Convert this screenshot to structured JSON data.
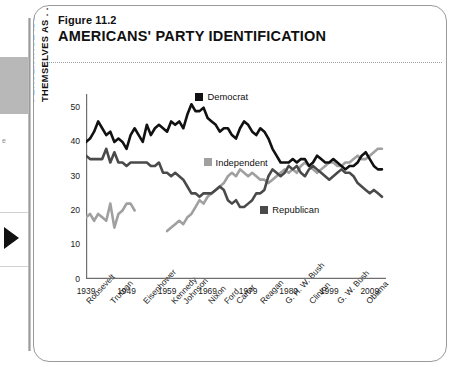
{
  "gutter": {
    "snippet_text": "e",
    "arrow_icon": "play-triangle-icon"
  },
  "figure": {
    "label": "Figure 11.2",
    "title": "AMERICANS' PARTY IDENTIFICATION"
  },
  "colors": {
    "democrat": "#111111",
    "republican": "#4a4a4a",
    "independent": "#a0a0a0",
    "axis": "#6f6f6f"
  },
  "chart_data": {
    "type": "line",
    "title": "AMERICANS' PARTY IDENTIFICATION",
    "xlabel": "",
    "ylabel": "PERCENTAGE IDENTIFYING THEMSELVES AS . . .",
    "ylabel_line1": "PERCENTAGE IDENTIFYING",
    "ylabel_line2": "THEMSELVES AS . . .",
    "xlim": [
      1939,
      2013
    ],
    "ylim": [
      0,
      54
    ],
    "yticks": [
      0,
      10,
      20,
      30,
      40,
      50
    ],
    "xticks": [
      1939,
      1949,
      1959,
      1969,
      1979,
      1989,
      1999,
      2009
    ],
    "grid": false,
    "legend_position": "inside-plot",
    "presidents": [
      "Roosevelt",
      "Truman",
      "Eisenhower",
      "Kennedy",
      "Johnson",
      "Nixon",
      "Ford",
      "Carter",
      "Reagan",
      "G. H. W. Bush",
      "Clinton",
      "G. W. Bush",
      "Obama"
    ],
    "president_years": [
      1941,
      1947,
      1955,
      1962,
      1965,
      1971,
      1975,
      1978,
      1984,
      1990,
      1996,
      2003,
      2010
    ],
    "legend": [
      {
        "name": "Democrat",
        "color": "#111111",
        "label_year": 1966,
        "label_value": 53
      },
      {
        "name": "Independent",
        "color": "#a0a0a0",
        "label_year": 1968,
        "label_value": 34
      },
      {
        "name": "Republican",
        "color": "#4a4a4a",
        "label_year": 1982,
        "label_value": 20
      }
    ],
    "series": [
      {
        "name": "Democrat",
        "color": "#111111",
        "points": [
          [
            1939,
            40
          ],
          [
            1940,
            41
          ],
          [
            1941,
            43
          ],
          [
            1942,
            46
          ],
          [
            1943,
            44
          ],
          [
            1944,
            42
          ],
          [
            1945,
            43
          ],
          [
            1946,
            40
          ],
          [
            1947,
            41
          ],
          [
            1948,
            40
          ],
          [
            1949,
            38
          ],
          [
            1950,
            42
          ],
          [
            1951,
            44
          ],
          [
            1952,
            42
          ],
          [
            1953,
            40
          ],
          [
            1954,
            45
          ],
          [
            1955,
            42
          ],
          [
            1956,
            44
          ],
          [
            1957,
            45
          ],
          [
            1958,
            44
          ],
          [
            1959,
            43
          ],
          [
            1960,
            46
          ],
          [
            1961,
            45
          ],
          [
            1962,
            46
          ],
          [
            1963,
            44
          ],
          [
            1964,
            48
          ],
          [
            1965,
            51
          ],
          [
            1966,
            49
          ],
          [
            1967,
            49
          ],
          [
            1968,
            50
          ],
          [
            1969,
            47
          ],
          [
            1970,
            46
          ],
          [
            1971,
            45
          ],
          [
            1972,
            43
          ],
          [
            1973,
            44
          ],
          [
            1974,
            44
          ],
          [
            1975,
            42
          ],
          [
            1976,
            41
          ],
          [
            1977,
            44
          ],
          [
            1978,
            46
          ],
          [
            1979,
            45
          ],
          [
            1980,
            43
          ],
          [
            1981,
            42
          ],
          [
            1982,
            44
          ],
          [
            1983,
            43
          ],
          [
            1984,
            41
          ],
          [
            1985,
            38
          ],
          [
            1986,
            36
          ],
          [
            1987,
            34
          ],
          [
            1988,
            34
          ],
          [
            1989,
            34
          ],
          [
            1990,
            35
          ],
          [
            1991,
            34
          ],
          [
            1992,
            35
          ],
          [
            1993,
            35
          ],
          [
            1994,
            33
          ],
          [
            1995,
            34
          ],
          [
            1996,
            36
          ],
          [
            1997,
            35
          ],
          [
            1998,
            34
          ],
          [
            1999,
            34
          ],
          [
            2000,
            35
          ],
          [
            2001,
            34
          ],
          [
            2002,
            33
          ],
          [
            2003,
            32
          ],
          [
            2004,
            33
          ],
          [
            2005,
            33
          ],
          [
            2006,
            34
          ],
          [
            2007,
            36
          ],
          [
            2008,
            37
          ],
          [
            2009,
            35
          ],
          [
            2010,
            33
          ],
          [
            2011,
            32
          ],
          [
            2012,
            32
          ]
        ]
      },
      {
        "name": "Republican",
        "color": "#4a4a4a",
        "points": [
          [
            1939,
            36
          ],
          [
            1940,
            35
          ],
          [
            1941,
            35
          ],
          [
            1942,
            35
          ],
          [
            1943,
            35
          ],
          [
            1944,
            38
          ],
          [
            1945,
            34
          ],
          [
            1946,
            37
          ],
          [
            1947,
            34
          ],
          [
            1948,
            34
          ],
          [
            1949,
            33
          ],
          [
            1950,
            34
          ],
          [
            1951,
            34
          ],
          [
            1952,
            34
          ],
          [
            1953,
            34
          ],
          [
            1954,
            34
          ],
          [
            1955,
            33
          ],
          [
            1956,
            33
          ],
          [
            1957,
            34
          ],
          [
            1958,
            31
          ],
          [
            1959,
            31
          ],
          [
            1960,
            30
          ],
          [
            1961,
            31
          ],
          [
            1962,
            30
          ],
          [
            1963,
            29
          ],
          [
            1964,
            27
          ],
          [
            1965,
            25
          ],
          [
            1966,
            25
          ],
          [
            1967,
            24
          ],
          [
            1968,
            25
          ],
          [
            1969,
            25
          ],
          [
            1970,
            25
          ],
          [
            1971,
            26
          ],
          [
            1972,
            27
          ],
          [
            1973,
            26
          ],
          [
            1974,
            23
          ],
          [
            1975,
            22
          ],
          [
            1976,
            23
          ],
          [
            1977,
            21
          ],
          [
            1978,
            21
          ],
          [
            1979,
            22
          ],
          [
            1980,
            23
          ],
          [
            1981,
            25
          ],
          [
            1982,
            25
          ],
          [
            1983,
            26
          ],
          [
            1984,
            30
          ],
          [
            1985,
            32
          ],
          [
            1986,
            31
          ],
          [
            1987,
            30
          ],
          [
            1988,
            31
          ],
          [
            1989,
            33
          ],
          [
            1990,
            32
          ],
          [
            1991,
            33
          ],
          [
            1992,
            31
          ],
          [
            1993,
            30
          ],
          [
            1994,
            32
          ],
          [
            1995,
            33
          ],
          [
            1996,
            32
          ],
          [
            1997,
            31
          ],
          [
            1998,
            30
          ],
          [
            1999,
            29
          ],
          [
            2000,
            30
          ],
          [
            2001,
            31
          ],
          [
            2002,
            32
          ],
          [
            2003,
            31
          ],
          [
            2004,
            31
          ],
          [
            2005,
            30
          ],
          [
            2006,
            28
          ],
          [
            2007,
            27
          ],
          [
            2008,
            26
          ],
          [
            2009,
            25
          ],
          [
            2010,
            26
          ],
          [
            2011,
            25
          ],
          [
            2012,
            24
          ]
        ]
      },
      {
        "name": "Independent",
        "color": "#a0a0a0",
        "points": [
          [
            1939,
            18
          ],
          [
            1940,
            19
          ],
          [
            1941,
            17
          ],
          [
            1942,
            19
          ],
          [
            1943,
            18
          ],
          [
            1944,
            17
          ],
          [
            1945,
            22
          ],
          [
            1946,
            15
          ],
          [
            1947,
            19
          ],
          [
            1948,
            20
          ],
          [
            1949,
            22
          ],
          [
            1950,
            22
          ],
          [
            1951,
            20
          ],
          [
            1959,
            14
          ],
          [
            1960,
            15
          ],
          [
            1961,
            16
          ],
          [
            1962,
            17
          ],
          [
            1963,
            16
          ],
          [
            1964,
            18
          ],
          [
            1965,
            19
          ],
          [
            1966,
            21
          ],
          [
            1967,
            23
          ],
          [
            1968,
            22
          ],
          [
            1969,
            24
          ],
          [
            1970,
            25
          ],
          [
            1971,
            26
          ],
          [
            1972,
            27
          ],
          [
            1973,
            28
          ],
          [
            1974,
            30
          ],
          [
            1975,
            31
          ],
          [
            1976,
            30
          ],
          [
            1977,
            32
          ],
          [
            1978,
            31
          ],
          [
            1979,
            30
          ],
          [
            1980,
            31
          ],
          [
            1981,
            30
          ],
          [
            1982,
            29
          ],
          [
            1983,
            29
          ],
          [
            1984,
            28
          ],
          [
            1985,
            29
          ],
          [
            1986,
            30
          ],
          [
            1987,
            31
          ],
          [
            1988,
            32
          ],
          [
            1989,
            31
          ],
          [
            1990,
            32
          ],
          [
            1991,
            31
          ],
          [
            1992,
            33
          ],
          [
            1993,
            34
          ],
          [
            1994,
            33
          ],
          [
            1995,
            32
          ],
          [
            1996,
            31
          ],
          [
            1997,
            32
          ],
          [
            1998,
            33
          ],
          [
            1999,
            34
          ],
          [
            2000,
            34
          ],
          [
            2001,
            33
          ],
          [
            2002,
            33
          ],
          [
            2003,
            34
          ],
          [
            2004,
            34
          ],
          [
            2005,
            35
          ],
          [
            2006,
            36
          ],
          [
            2007,
            35
          ],
          [
            2008,
            35
          ],
          [
            2009,
            36
          ],
          [
            2010,
            37
          ],
          [
            2011,
            38
          ],
          [
            2012,
            38
          ]
        ]
      }
    ]
  }
}
